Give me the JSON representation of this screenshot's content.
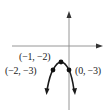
{
  "figure": {
    "type": "parabola-graph",
    "colors": {
      "axis": "#8a8a8a",
      "curve": "#1a1a1a",
      "point": "#111111",
      "label": "#222222",
      "background": "#ffffff"
    }
  },
  "points": [
    {
      "label": "(−1, −2)",
      "x": -1,
      "y": -2,
      "role": "vertex"
    },
    {
      "label": "(−2, −3)",
      "x": -2,
      "y": -3,
      "role": "point"
    },
    {
      "label": "(0, −3)",
      "x": 0,
      "y": -3,
      "role": "point"
    }
  ],
  "labels": {
    "vertex": "(−1, −2)",
    "left": "(−2, −3)",
    "right": "(0, −3)"
  }
}
